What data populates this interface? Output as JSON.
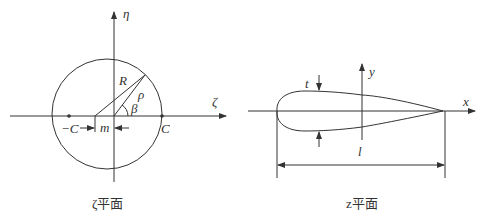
{
  "left_panel": {
    "caption": "ζ平面",
    "axis_h_label": "ζ",
    "axis_v_label": "η",
    "radius_label": "R",
    "rho_label": "ρ",
    "angle_label": "β",
    "neg_c_label": "−C",
    "c_label": "C",
    "m_label": "m"
  },
  "right_panel": {
    "caption": "z平面",
    "axis_x_label": "x",
    "axis_y_label": "y",
    "thickness_label": "t",
    "chord_label": "l"
  }
}
